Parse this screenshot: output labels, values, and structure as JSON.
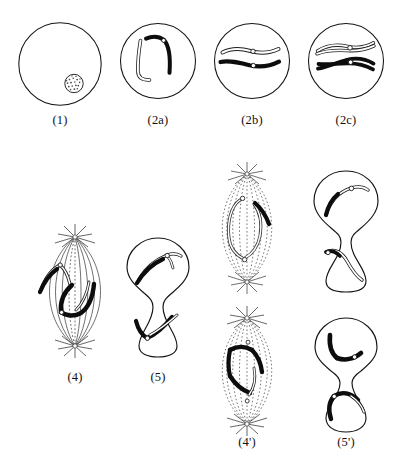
{
  "diagram": {
    "background_color": "#ffffff",
    "ink_color": "#101010",
    "chromosome_dark_color": "#0d0d0d",
    "chromosome_light_color": "#ffffff",
    "centromere_color": "#ffffff"
  },
  "panels": [
    {
      "id": "panel-1",
      "label": "(1)",
      "kind": "cell-circle",
      "description": "Resting cell with stippled nucleus in lower right",
      "contents": [
        "nucleus-stippled"
      ]
    },
    {
      "id": "panel-2a",
      "label": "(2a)",
      "kind": "cell-circle",
      "description": "Cell with two bent chromosomes, one light outlined and one dark",
      "contents": [
        "chromosome-light-bent",
        "chromosome-dark-bent",
        "centromere-dot"
      ]
    },
    {
      "id": "panel-2b",
      "label": "(2b)",
      "kind": "cell-circle",
      "description": "Cell with two horizontal chromosomes each bearing a centromere",
      "contents": [
        "chromosome-light-horizontal",
        "chromosome-dark-horizontal",
        "centromere-dot",
        "centromere-dot"
      ]
    },
    {
      "id": "panel-2c",
      "label": "(2c)",
      "kind": "cell-circle",
      "description": "Cell with split duplicated chromosomes forming crossed loops",
      "contents": [
        "chromosome-light-split-loop",
        "chromosome-dark-split-loop",
        "centromere-dot",
        "centromere-dot"
      ]
    },
    {
      "id": "panel-4",
      "label": "(4)",
      "kind": "spindle-solid",
      "description": "Spindle with asters at both poles, solid fibres, dark and light V chromosomes",
      "contents": [
        "aster-top",
        "aster-bottom",
        "spindle-fibres-solid",
        "chromosome-light-v",
        "chromosome-dark-v"
      ]
    },
    {
      "id": "panel-5",
      "label": "(5)",
      "kind": "cell-dumbbell",
      "description": "Dividing cell, two lobes each holding a dark and light chromosome pair",
      "contents": [
        "chromosome-dark-v",
        "chromosome-light-v",
        "chromosome-dark-v",
        "chromosome-light-v"
      ]
    },
    {
      "id": "panel-unlabeled-top-spindle",
      "label": "",
      "kind": "spindle-dotted",
      "description": "Spindle with dotted fibres and light chromosomes with one dark segment",
      "contents": [
        "aster-top",
        "aster-bottom",
        "spindle-fibres-dotted",
        "chromosome-light-v",
        "chromosome-dark-segment"
      ]
    },
    {
      "id": "panel-unlabeled-top-dumbbell",
      "label": "",
      "kind": "cell-dumbbell",
      "description": "Dividing cell with light chromosomes, one partly dark, in each lobe",
      "contents": [
        "chromosome-light-curved",
        "chromosome-dark-curved"
      ]
    },
    {
      "id": "panel-4-prime",
      "label": "(4')",
      "kind": "spindle-dotted",
      "description": "Spindle with dotted fibres and dark chromosomes at equator",
      "contents": [
        "aster-top",
        "aster-bottom",
        "spindle-fibres-dotted",
        "chromosome-dark-v",
        "chromosome-dark-v"
      ]
    },
    {
      "id": "panel-5-prime",
      "label": "(5')",
      "kind": "cell-dumbbell",
      "description": "Dividing cell with dark hooked chromosomes in each lobe",
      "contents": [
        "chromosome-dark-hook",
        "chromosome-dark-hook",
        "centromere-dot",
        "centromere-dot"
      ]
    }
  ],
  "captions": {
    "c1": "(1)",
    "c2a": "(2a)",
    "c2b": "(2b)",
    "c2c": "(2c)",
    "c4": "(4)",
    "c5": "(5)",
    "c4p": "(4')",
    "c5p": "(5')"
  }
}
